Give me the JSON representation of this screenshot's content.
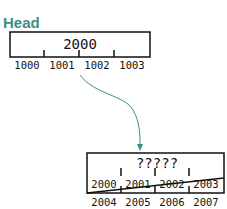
{
  "diagram": {
    "head_label": "Head",
    "top_block": {
      "value": "2000",
      "slots": [
        "1000",
        "1001",
        "1002",
        "1003"
      ]
    },
    "bottom_block": {
      "value": "?????",
      "upper_slots": [
        "2000",
        "2001",
        "2002",
        "2003"
      ],
      "lower_slots": [
        "2004",
        "2005",
        "2006",
        "2007"
      ]
    },
    "arrow_color": "#3a8f8a",
    "head_color": "#3a8f8a"
  }
}
